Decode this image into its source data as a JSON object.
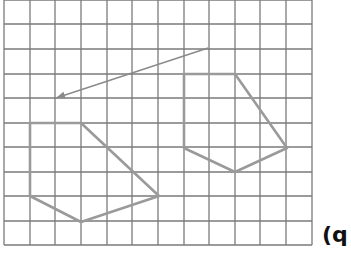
{
  "figure": {
    "grid": {
      "x_lines": [
        4,
        30,
        55,
        81,
        107,
        132,
        158,
        184,
        209,
        235,
        260,
        286,
        312
      ],
      "y_lines": [
        0,
        24,
        49,
        74,
        98,
        123,
        147,
        172,
        196,
        221,
        245
      ],
      "color": "#7a7a7a"
    },
    "shapes": [
      {
        "name": "image-pentagon",
        "points": [
          [
            30,
            123
          ],
          [
            81,
            123
          ],
          [
            159,
            196
          ],
          [
            81,
            222
          ],
          [
            30,
            196
          ]
        ],
        "color": "#9a9a9a"
      },
      {
        "name": "object-pentagon",
        "points": [
          [
            184,
            74
          ],
          [
            235,
            74
          ],
          [
            287,
            148
          ],
          [
            235,
            172
          ],
          [
            184,
            148
          ]
        ],
        "color": "#9a9a9a"
      }
    ],
    "arrow": {
      "from": [
        208,
        48
      ],
      "to": [
        56,
        98
      ],
      "color": "#8a8a8a"
    },
    "label": "(q"
  }
}
